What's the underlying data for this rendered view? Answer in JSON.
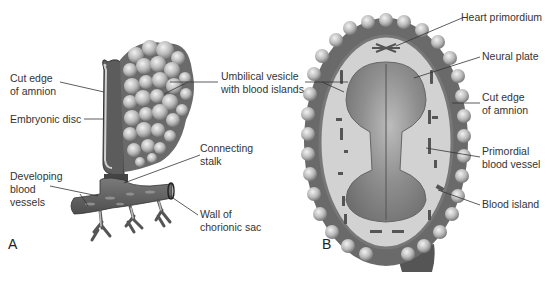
{
  "figure": {
    "panel_a": {
      "letter": "A",
      "labels": {
        "cut_edge_amnion": "Cut edge\nof amnion",
        "embryonic_disc": "Embryonic disc",
        "umbilical_vesicle": "Umbilical vesicle\nwith blood islands",
        "connecting_stalk": "Connecting\nstalk",
        "developing_blood_vessels": "Developing\nblood\nvessels",
        "wall_chorionic_sac": "Wall of\nchorionic sac"
      }
    },
    "panel_b": {
      "letter": "B",
      "labels": {
        "heart_primordium": "Heart primordium",
        "neural_plate": "Neural plate",
        "cut_edge_amnion": "Cut edge\nof amnion",
        "primordial_blood_vessel": "Primordial\nblood vessel",
        "blood_island": "Blood island"
      }
    },
    "colors": {
      "tissue_dark": "#5e5e5e",
      "tissue_mid": "#8a8a8a",
      "tissue_light": "#c9c9c9",
      "leader_line": "#333333"
    }
  }
}
